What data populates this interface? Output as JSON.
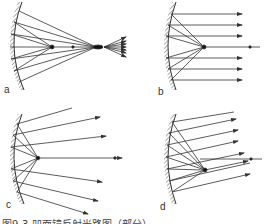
{
  "figure": {
    "panels": [
      {
        "id": "a",
        "label": "a",
        "description": "Light source beyond focus: rays converge to a real image point then diverge"
      },
      {
        "id": "b",
        "label": "b",
        "description": "Light source at focus: reflected rays parallel to axis"
      },
      {
        "id": "c",
        "label": "c",
        "description": "Light source inside focus: reflected rays diverge"
      },
      {
        "id": "d",
        "label": "d",
        "description": "Light source off axis at focal plane: reflected rays parallel but tilted"
      }
    ],
    "caption": "图9-3  凹面镜反射光路图（部分）",
    "colors": {
      "line": "#333333",
      "mirror_hatch": "#555555",
      "background": "#ffffff"
    }
  }
}
